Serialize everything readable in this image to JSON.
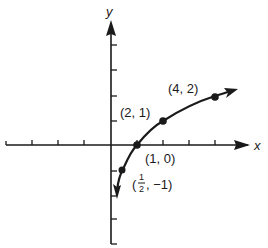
{
  "diagram": {
    "type": "function-graph",
    "function": "y = log2(x)",
    "axes": {
      "x_label": "x",
      "y_label": "y",
      "origin_px": [
        111,
        145
      ],
      "x_unit_px": 26,
      "y_unit_px": 25,
      "x_ticks": [
        -4,
        -3,
        -2,
        -1,
        1,
        2,
        3,
        4
      ],
      "y_ticks_positive": [
        1,
        2,
        3,
        4
      ],
      "y_ticks_negative": [
        -1,
        -2,
        -3,
        -4
      ]
    },
    "points": [
      {
        "x": 0.5,
        "y": -1,
        "label_open": "(",
        "label_num": "1",
        "label_den": "2",
        "label_rest": ", −1)"
      },
      {
        "x": 1,
        "y": 0,
        "label": "(1, 0)"
      },
      {
        "x": 2,
        "y": 1,
        "label": "(2, 1)"
      },
      {
        "x": 4,
        "y": 2,
        "label": "(4, 2)"
      }
    ],
    "colors": {
      "ink": "#1a1a1a",
      "background": "#ffffff"
    }
  }
}
